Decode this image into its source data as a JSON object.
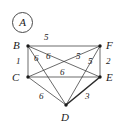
{
  "figure": {
    "tag": "A",
    "type": "weighted-graph"
  },
  "graph_data": {
    "type": "graph",
    "title": "A",
    "vertices": [
      {
        "id": "B",
        "label": "B",
        "x": 28,
        "y": 46,
        "label_x": 13,
        "label_y": 40
      },
      {
        "id": "F",
        "label": "F",
        "x": 100,
        "y": 46,
        "label_x": 106,
        "label_y": 40
      },
      {
        "id": "C",
        "label": "C",
        "x": 28,
        "y": 77,
        "label_x": 12,
        "label_y": 72
      },
      {
        "id": "E",
        "label": "E",
        "x": 100,
        "y": 77,
        "label_x": 106,
        "label_y": 72
      },
      {
        "id": "D",
        "label": "D",
        "x": 66,
        "y": 105,
        "label_x": 61,
        "label_y": 112
      }
    ],
    "edges": [
      {
        "from": "B",
        "to": "F",
        "weight": "5",
        "bold": false,
        "label_x": 44,
        "label_y": 33
      },
      {
        "from": "B",
        "to": "C",
        "weight": "1",
        "bold": false,
        "label_x": 16,
        "label_y": 57
      },
      {
        "from": "F",
        "to": "E",
        "weight": "2",
        "bold": false,
        "label_x": 106,
        "label_y": 57
      },
      {
        "from": "C",
        "to": "E",
        "weight": "6",
        "bold": false,
        "label_x": 60,
        "label_y": 68
      },
      {
        "from": "C",
        "to": "D",
        "weight": "6",
        "bold": false,
        "label_x": 39,
        "label_y": 92
      },
      {
        "from": "D",
        "to": "E",
        "weight": "3",
        "bold": true,
        "label_x": 85,
        "label_y": 92
      },
      {
        "from": "B",
        "to": "E",
        "weight": "6",
        "bold": false,
        "label_x": 34,
        "label_y": 54
      },
      {
        "from": "B",
        "to": "D",
        "weight": "6",
        "bold": false,
        "label_x": 46,
        "label_y": 52
      },
      {
        "from": "C",
        "to": "F",
        "weight": "5",
        "bold": false,
        "label_x": 76,
        "label_y": 52
      },
      {
        "from": "D",
        "to": "F",
        "weight": "5",
        "bold": false,
        "label_x": 88,
        "label_y": 57
      }
    ]
  }
}
